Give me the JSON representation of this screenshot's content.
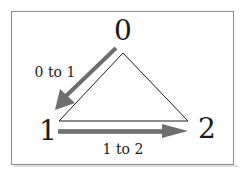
{
  "nodes": [
    {
      "id": "node-0",
      "label": "0"
    },
    {
      "id": "node-1",
      "label": "1"
    },
    {
      "id": "node-2",
      "label": "2"
    }
  ],
  "edges": [
    {
      "id": "edge-0-1",
      "label": "0 to 1"
    },
    {
      "id": "edge-1-2",
      "label": "1 to 2"
    }
  ],
  "colors": {
    "arrow": "#6e6e6e",
    "triangle": "#1a1a1a",
    "frame": "#8a8a8a"
  }
}
